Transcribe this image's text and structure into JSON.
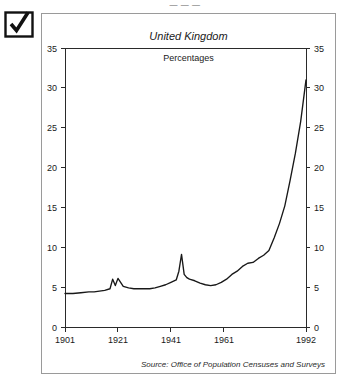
{
  "top_caption": "— — —",
  "marker": {
    "icon": "checked-checkbox-icon"
  },
  "chart_data": {
    "type": "line",
    "title": "United Kingdom",
    "subtitle": "Percentages",
    "xlabel": "",
    "ylabel": "",
    "xlim": [
      1901,
      1992
    ],
    "ylim": [
      0,
      35
    ],
    "grid": false,
    "legend": null,
    "source": "Source: Office of Population Censuses and Surveys",
    "y_ticks": [
      0,
      5,
      10,
      15,
      20,
      25,
      30,
      35
    ],
    "y_tick_labels": [
      "0",
      "5",
      "10",
      "15",
      "20",
      "25",
      "30",
      "35"
    ],
    "y_axis_mirrored": true,
    "x_ticks": [
      1901,
      1921,
      1941,
      1961,
      1992
    ],
    "x_tick_labels": [
      "1901",
      "1921",
      "1941",
      "1961",
      "1992"
    ],
    "series": [
      {
        "name": "United Kingdom",
        "x": [
          1901,
          1904,
          1907,
          1910,
          1912,
          1914,
          1916,
          1918,
          1919,
          1920,
          1921,
          1923,
          1925,
          1927,
          1929,
          1931,
          1933,
          1935,
          1937,
          1939,
          1941,
          1943,
          1944,
          1945,
          1946,
          1947,
          1948,
          1950,
          1952,
          1954,
          1956,
          1958,
          1960,
          1962,
          1964,
          1966,
          1968,
          1970,
          1972,
          1974,
          1976,
          1978,
          1980,
          1982,
          1984,
          1986,
          1988,
          1990,
          1992
        ],
        "y": [
          4.2,
          4.2,
          4.3,
          4.4,
          4.4,
          4.5,
          4.6,
          4.8,
          6.0,
          5.2,
          6.1,
          5.1,
          4.9,
          4.8,
          4.8,
          4.8,
          4.8,
          4.9,
          5.1,
          5.3,
          5.6,
          5.9,
          7.0,
          9.1,
          6.6,
          6.2,
          6.0,
          5.8,
          5.5,
          5.3,
          5.2,
          5.3,
          5.6,
          6.0,
          6.6,
          7.0,
          7.6,
          8.0,
          8.1,
          8.6,
          9.0,
          9.6,
          11.2,
          13.0,
          15.2,
          18.4,
          21.8,
          25.8,
          31.0
        ]
      }
    ]
  }
}
